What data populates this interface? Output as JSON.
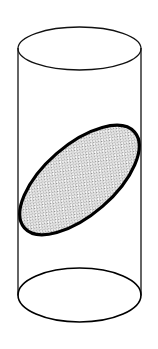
{
  "figure": {
    "title": "Cylinder with oblique elliptical cross-section",
    "canvas": {
      "width": 158,
      "height": 349,
      "background_color": "#ffffff"
    },
    "colors": {
      "outline": "#000000",
      "thin_outline": "#1a1a1a",
      "section_fill_base": "#ffffff",
      "section_fill_dots": "#9a9a9a",
      "background": "#ffffff"
    },
    "stroke_widths": {
      "top_rim": 1.3,
      "bottom_rim": 1.6,
      "side_wall": 1.3,
      "section_ellipse": 3.2
    },
    "parts": [
      {
        "name": "top-rim-ellipse",
        "label": "Top rim",
        "shape": "ellipse",
        "cx": 79.5,
        "cy": 48.5,
        "rx": 61.5,
        "ry": 21.5,
        "rotation": 0,
        "filled": false
      },
      {
        "name": "bottom-rim-ellipse",
        "label": "Bottom rim",
        "shape": "ellipse",
        "cx": 79.5,
        "cy": 295,
        "rx": 61.5,
        "ry": 27,
        "rotation": 0,
        "filled": false
      },
      {
        "name": "left-wall-line",
        "label": "Left side wall",
        "shape": "line",
        "x1": 18,
        "y1": 48.5,
        "x2": 18,
        "y2": 295
      },
      {
        "name": "right-wall-line",
        "label": "Right side wall",
        "shape": "line",
        "x1": 141,
        "y1": 48.5,
        "x2": 141,
        "y2": 295
      },
      {
        "name": "cross-section-ellipse",
        "label": "Oblique cross-section",
        "shape": "ellipse",
        "cx": 79.5,
        "cy": 180,
        "rx": 73,
        "ry": 35,
        "rotation": -41,
        "filled": true,
        "fill_pattern": "fine-dot-grid"
      }
    ],
    "pattern": {
      "name": "fine-dot-grid",
      "pitch": 2.2,
      "dot_size": 1.1,
      "dot_color": "#8f8f8f",
      "base_color": "#ffffff"
    }
  }
}
